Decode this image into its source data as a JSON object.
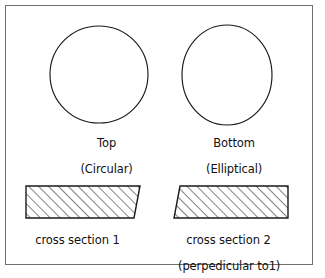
{
  "figure": {
    "background_color": "#ffffff",
    "line_color": "#1a1a1a",
    "frame_color": "#6f6f6f",
    "shapes": {
      "top_circle": {
        "icon": "circle-outline-icon",
        "cx": 99,
        "cy": 74.5,
        "rx": 49,
        "ry": 48.5
      },
      "bottom_ellipse": {
        "icon": "ellipse-outline-icon",
        "cx": 227,
        "cy": 75,
        "rx": 45,
        "ry": 50
      },
      "cross_section_1": {
        "icon": "hatched-trapezoid-icon",
        "points": "26,186 140,186 134,218 26,218"
      },
      "cross_section_2": {
        "icon": "hatched-trapezoid-icon",
        "points": "180,186 288,186 288,218 174,218"
      }
    },
    "hatch": {
      "angle_degrees": 45,
      "spacing_px": 7,
      "stroke_width": 1
    },
    "labels": {
      "top_name": "Top",
      "top_shape": "(Circular)",
      "bottom_name": "Bottom",
      "bottom_shape": "(Elliptical)",
      "cross_section_1": "cross section 1",
      "cross_section_2": "cross section 2",
      "cross_section_2_note": "(perpedicular to1)"
    }
  }
}
